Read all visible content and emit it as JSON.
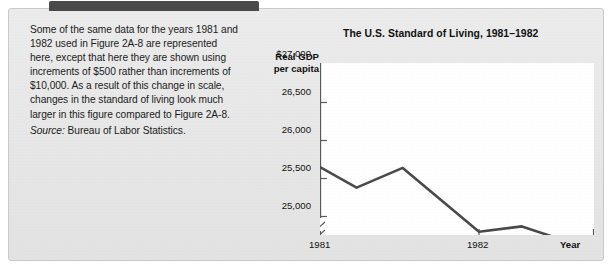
{
  "caption": {
    "paragraph": "Some of the same data for the years 1981 and 1982 used in Figure 2A-8 are represented here, except that here they are shown using increments of $500 rather than increments of $10,000. As a result of this change in scale, changes in the standard of living look much larger in this figure compared to Figure 2A-8.",
    "source_label": "Source:",
    "source_text": " Bureau of Labor Statistics."
  },
  "chart_data": {
    "type": "line",
    "title": "The U.S. Standard of Living, 1981–1982",
    "ylabel": "Real GDP\nper capita",
    "ylabel_line1": "Real GDP",
    "ylabel_line2": "per capita",
    "xlabel": "Year",
    "ytick_labels": [
      "$27,000",
      "26,500",
      "26,000",
      "25,500",
      "25,000"
    ],
    "ytick_values": [
      27000,
      26500,
      26000,
      25500,
      25000
    ],
    "ylim": [
      25000,
      27000
    ],
    "y_axis_break": true,
    "xtick_labels": [
      "1981",
      "1982"
    ],
    "xtick_values": [
      1981,
      1982
    ],
    "xlim": [
      1981,
      1982.75
    ],
    "grid": false,
    "legend": null,
    "line_color": "#4a4a4a",
    "x": [
      1981.0,
      1981.23,
      1981.52,
      1982.0,
      1982.27,
      1982.47,
      1982.75
    ],
    "values": [
      26150,
      25880,
      26140,
      25300,
      25370,
      25230,
      25180
    ],
    "series": [
      {
        "name": "Real GDP per capita",
        "points": [
          {
            "x": 1981.0,
            "y": 26150
          },
          {
            "x": 1981.23,
            "y": 25880
          },
          {
            "x": 1981.52,
            "y": 26140
          },
          {
            "x": 1982.0,
            "y": 25300
          },
          {
            "x": 1982.27,
            "y": 25370
          },
          {
            "x": 1982.47,
            "y": 25230
          },
          {
            "x": 1982.75,
            "y": 25180
          }
        ]
      }
    ]
  }
}
